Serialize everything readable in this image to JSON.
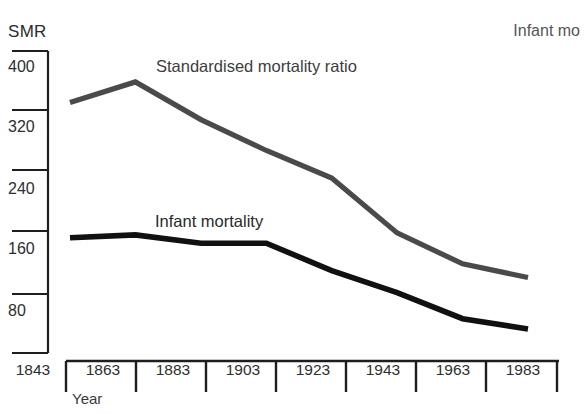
{
  "figure": {
    "y_axis_title": "SMR",
    "x_axis_title": "Year",
    "corner_note": "Infant mo"
  },
  "series_labels": {
    "smr": "Standardised mortality ratio",
    "imr": "Infant mortality"
  },
  "colors": {
    "smr_line": "#4a4a4a",
    "imr_line": "#111111",
    "axis": "#1e1e1e",
    "text": "#2e2e2e",
    "background": "#ffffff"
  },
  "chart_data": {
    "type": "line",
    "title": "",
    "subtitle": "",
    "xlabel": "Year",
    "ylabel": "SMR",
    "x": [
      1843,
      1863,
      1883,
      1903,
      1923,
      1943,
      1963,
      1983
    ],
    "categories": [
      "1843",
      "1863",
      "1883",
      "1903",
      "1923",
      "1943",
      "1963",
      "1983"
    ],
    "xtick_labels": [
      "1843",
      "1863",
      "1883",
      "1903",
      "1923",
      "1943",
      "1963",
      "1983"
    ],
    "ytick_labels": [
      "400",
      "320",
      "240",
      "160",
      "80"
    ],
    "yticks": [
      400,
      320,
      240,
      160,
      80
    ],
    "ylim": [
      0,
      440
    ],
    "xlim": [
      1843,
      1983
    ],
    "grid": false,
    "legend": "inline-annotations",
    "legend_position": "on-plot",
    "series": [
      {
        "name": "Standardised mortality ratio",
        "color": "#4a4a4a",
        "values": [
          365,
          395,
          340,
          295,
          255,
          175,
          130,
          110
        ]
      },
      {
        "name": "Infant mortality",
        "color": "#111111",
        "values": [
          168,
          172,
          160,
          160,
          120,
          88,
          50,
          35
        ]
      }
    ],
    "annotations": [
      {
        "text": "Standardised mortality ratio",
        "x": 1883,
        "y": 400
      },
      {
        "text": "Infant mortality",
        "x": 1883,
        "y": 195
      },
      {
        "text": "Infant mo",
        "x": 1983,
        "y": 440
      }
    ]
  }
}
